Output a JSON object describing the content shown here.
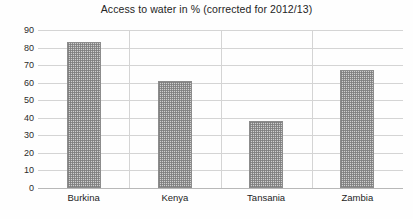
{
  "chart_data": {
    "type": "bar",
    "title": "Access to water in % (corrected for 2012/13)",
    "xlabel": "",
    "ylabel": "",
    "categories": [
      "Burkina",
      "Kenya",
      "Tansania",
      "Zambia"
    ],
    "values": [
      83,
      61,
      38,
      67
    ],
    "ylim": [
      0,
      90
    ],
    "ytick_step": 10,
    "yticks": [
      90,
      80,
      70,
      60,
      50,
      40,
      30,
      20,
      10,
      0
    ],
    "ytick_labels": [
      "90",
      "80",
      "70",
      "60",
      "50",
      "40",
      "30",
      "20",
      "10",
      "0"
    ],
    "grid": true,
    "grid_axis": "both",
    "legend": false,
    "legend_position": "none",
    "series": [
      {
        "name": "Access to water in %",
        "values": [
          83,
          61,
          38,
          67
        ]
      }
    ],
    "colors": {
      "bar_fill": "#cfcfcf",
      "bar_pattern": "#7d7d7d",
      "bar_border": "#8c8c8c",
      "gridline": "#d4d4d4",
      "axis_line": "#b8b8b8",
      "text": "#242424",
      "background": "#fefefe"
    }
  }
}
